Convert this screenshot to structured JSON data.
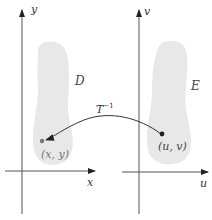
{
  "diagram": {
    "left_plane": {
      "horizontal_axis_label": "x",
      "vertical_axis_label": "y",
      "region_label": "D",
      "point_label": "(x, y)"
    },
    "right_plane": {
      "horizontal_axis_label": "u",
      "vertical_axis_label": "v",
      "region_label": "E",
      "point_label": "(u, v)"
    },
    "mapping": {
      "base": "T",
      "exponent": "−1"
    },
    "colors": {
      "axis": "#555555",
      "region_fill": "#e8e8e8",
      "arrow": "#333333",
      "point_left": "#777777",
      "point_right": "#222222"
    }
  }
}
